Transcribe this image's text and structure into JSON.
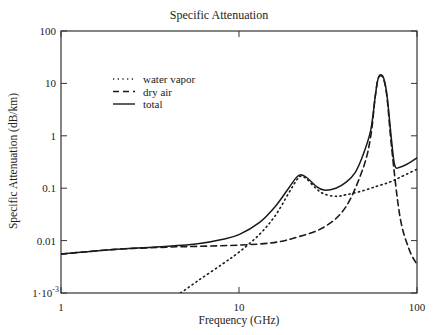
{
  "chart_data": {
    "type": "line",
    "title": "Specific Attenuation",
    "xlabel": "Frequency (GHz)",
    "ylabel": "Specific Attenuation (dB/km)",
    "xscale": "log",
    "yscale": "log",
    "xlim": [
      1,
      100
    ],
    "ylim": [
      0.001,
      100
    ],
    "x_ticks": [
      "1",
      "10",
      "100"
    ],
    "y_ticks": [
      "1·10^-3",
      "0.01",
      "0.1",
      "1",
      "10",
      "100"
    ],
    "grid": false,
    "legend": {
      "position": "upper-left",
      "entries": [
        {
          "label": "water vapor",
          "style": "dotted"
        },
        {
          "label": "dry air",
          "style": "dashed"
        },
        {
          "label": "total",
          "style": "solid"
        }
      ]
    },
    "series": [
      {
        "name": "water vapor",
        "style": "dotted",
        "x": [
          4.7,
          6,
          8,
          10,
          13,
          16,
          19,
          21,
          22.2,
          24,
          27,
          30,
          35,
          40,
          50,
          60,
          70,
          80,
          100
        ],
        "y": [
          0.001,
          0.0018,
          0.0035,
          0.006,
          0.013,
          0.03,
          0.08,
          0.14,
          0.17,
          0.15,
          0.1,
          0.078,
          0.07,
          0.075,
          0.09,
          0.11,
          0.13,
          0.16,
          0.23
        ]
      },
      {
        "name": "dry air",
        "style": "dashed",
        "x": [
          1,
          2,
          4,
          6,
          10,
          15,
          20,
          30,
          40,
          50,
          55,
          58,
          60,
          62,
          65,
          68,
          72,
          80,
          90,
          100
        ],
        "y": [
          0.0055,
          0.0068,
          0.0075,
          0.0078,
          0.0082,
          0.009,
          0.011,
          0.018,
          0.045,
          0.25,
          1.0,
          5.0,
          11.0,
          14.0,
          12.0,
          5.0,
          0.6,
          0.03,
          0.007,
          0.0035
        ]
      },
      {
        "name": "total",
        "style": "solid",
        "x": [
          1,
          2,
          4,
          6,
          8,
          10,
          13,
          16,
          19,
          21,
          22.2,
          24,
          27,
          30,
          35,
          40,
          45,
          50,
          55,
          58,
          60,
          62,
          65,
          68,
          72,
          75,
          80,
          90,
          100
        ],
        "y": [
          0.0056,
          0.0068,
          0.0078,
          0.0088,
          0.0105,
          0.013,
          0.022,
          0.045,
          0.1,
          0.16,
          0.18,
          0.16,
          0.11,
          0.092,
          0.1,
          0.13,
          0.2,
          0.45,
          1.3,
          5.0,
          11.0,
          14.5,
          12.5,
          5.5,
          0.8,
          0.27,
          0.25,
          0.3,
          0.38
        ]
      }
    ]
  },
  "labels": {
    "title": "Specific Attenuation",
    "xlabel": "Frequency (GHz)",
    "ylabel": "Specific Attenuation (dB/km)"
  }
}
